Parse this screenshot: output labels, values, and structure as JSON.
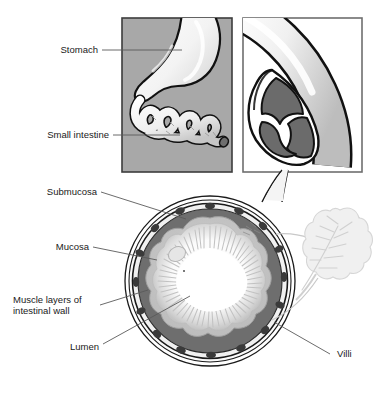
{
  "figure": {
    "title_alt": "Anatomy of the stomach and small intestine with intestinal wall cross-section",
    "background_color": "#ffffff"
  },
  "panels": {
    "left": {
      "name": "stomach-and-small-intestine-panel",
      "background_color": "#a8a8a8",
      "border_color": "#3c3c3c",
      "organs": [
        "Stomach",
        "Small intestine"
      ]
    },
    "right": {
      "name": "intestine-cutaway-panel",
      "background_color": "#ffffff",
      "border_color": "#6e6e6e",
      "contents_color": "#6b6b6b"
    }
  },
  "labels": [
    {
      "id": "stomach",
      "text": "Stomach",
      "text2": ""
    },
    {
      "id": "small-intestine",
      "text": "Small intestine",
      "text2": ""
    },
    {
      "id": "submucosa",
      "text": "Submucosa",
      "text2": ""
    },
    {
      "id": "mucosa",
      "text": "Mucosa",
      "text2": ""
    },
    {
      "id": "muscle-layers",
      "text": "Muscle layers of",
      "text2": "intestinal wall"
    },
    {
      "id": "lumen",
      "text": "Lumen",
      "text2": ""
    },
    {
      "id": "villi",
      "text": "Villi",
      "text2": ""
    }
  ],
  "cross_section": {
    "name": "intestinal-wall-cross-section",
    "layers": [
      {
        "name": "serosa",
        "color": "#f2f2f2"
      },
      {
        "name": "muscle-layers",
        "color": "#6e6e6e"
      },
      {
        "name": "submucosa",
        "color": "#c9c9c9"
      },
      {
        "name": "mucosa",
        "color": "#d8d8d8"
      },
      {
        "name": "lumen",
        "color": "#ffffff"
      }
    ],
    "outline_color": "#1a1a1a"
  },
  "villus_detail": {
    "name": "magnified-villus",
    "fill_color": "#ededed",
    "outline_color": "#cfcfcf"
  },
  "leader_line_color": "#5a5a5a"
}
